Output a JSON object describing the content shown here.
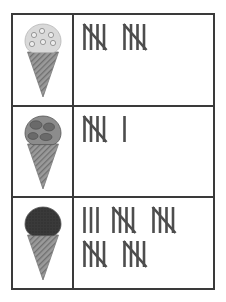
{
  "worksheet": {
    "title": "Ice Cream Tally Chart",
    "type": "tally-table",
    "colors": {
      "border": "#3a3a3a",
      "tally_stroke": "#4d4d4d",
      "cone": "#9a9a9a",
      "scoop_vanilla_chip": "#d9d9d9",
      "scoop_medium": "#8c8c8c",
      "scoop_dark": "#3a3a3a",
      "background": "#ffffff"
    },
    "rows": [
      {
        "id": "row-vanilla-chip",
        "icon_name": "ice-cream-cone-light-chip-icon",
        "icon_label": "Light ice cream cone with chips",
        "scoop_color": "#d9d9d9",
        "tally_total": 10,
        "tally_groups": [
          5,
          5
        ],
        "tally_lines": [
          [
            5,
            5
          ]
        ]
      },
      {
        "id": "row-medium",
        "icon_name": "ice-cream-cone-medium-icon",
        "icon_label": "Medium gray ice cream cone",
        "scoop_color": "#8c8c8c",
        "tally_total": 6,
        "tally_groups": [
          5,
          1
        ],
        "tally_lines": [
          [
            5,
            1
          ]
        ]
      },
      {
        "id": "row-dark",
        "icon_name": "ice-cream-cone-dark-icon",
        "icon_label": "Dark ice cream cone",
        "scoop_color": "#3a3a3a",
        "tally_total": 23,
        "tally_groups": [
          3,
          5,
          5,
          5,
          5
        ],
        "tally_lines": [
          [
            3,
            5,
            5
          ],
          [
            5,
            5
          ]
        ]
      }
    ]
  }
}
